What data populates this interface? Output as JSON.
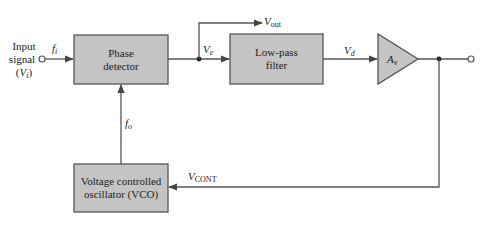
{
  "diagram": {
    "colors": {
      "block_fill": "#c4c4c4",
      "block_stroke": "#555555",
      "line": "#555555",
      "background": "#ffffff"
    },
    "input": {
      "line1": "Input",
      "line2": "signal",
      "line3_open": "(",
      "line3_var": "V",
      "line3_sub": "i",
      "line3_close": ")",
      "freq_var": "f",
      "freq_sub": "i"
    },
    "blocks": {
      "phase_detector": {
        "line1": "Phase",
        "line2": "detector"
      },
      "low_pass_filter": {
        "line1": "Low-pass",
        "line2": "filter"
      },
      "amplifier": {
        "var": "A",
        "sub": "v"
      },
      "vco": {
        "line1": "Voltage controlled",
        "line2": "oscillator (VCO)"
      }
    },
    "signals": {
      "ve": {
        "var": "V",
        "sub": "e"
      },
      "vout": {
        "var": "V",
        "sub": "out"
      },
      "vd": {
        "var": "V",
        "sub": "d"
      },
      "fo": {
        "var": "f",
        "sub": "o"
      },
      "vcont": {
        "var": "V",
        "sub": "CONT"
      }
    }
  }
}
